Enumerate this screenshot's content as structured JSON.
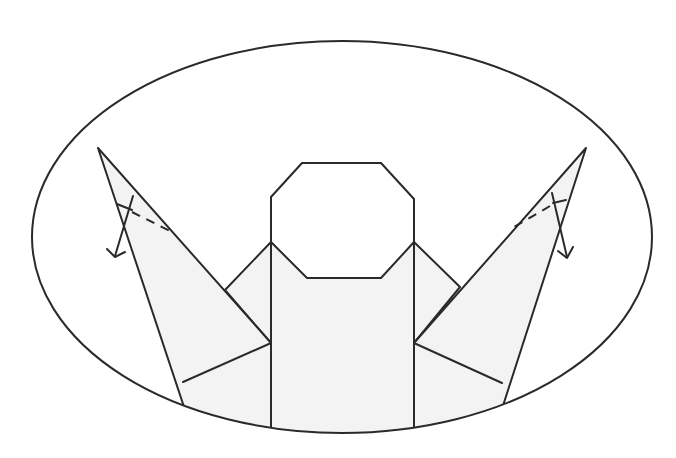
{
  "diagram": {
    "elements": [
      {
        "name": "oval-frame",
        "description": "Elliptical frame enclosing the model"
      },
      {
        "name": "head",
        "shape": "octagon",
        "description": "Octagonal head (unshaded)"
      },
      {
        "name": "body",
        "shape": "rectangle",
        "description": "Central shaded body"
      },
      {
        "name": "left-wing",
        "description": "Left raised wing point with valley-fold dashed line and arrow"
      },
      {
        "name": "right-wing",
        "description": "Right raised wing point with valley-fold dashed line and arrow"
      }
    ],
    "instructions": [
      {
        "side": "left",
        "fold": "valley",
        "arrow": "down"
      },
      {
        "side": "right",
        "fold": "valley",
        "arrow": "down"
      }
    ],
    "colors": {
      "line": "#2a2a2a",
      "paper_shaded": "#f3f3f3",
      "paper_white": "#ffffff"
    }
  }
}
